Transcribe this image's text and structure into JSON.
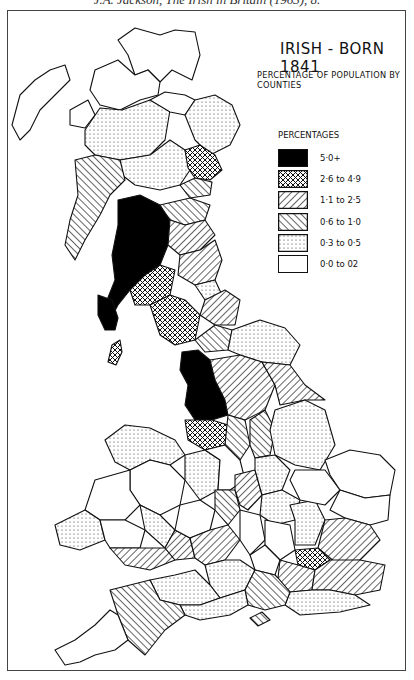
{
  "caption": "J.A. Jackson, The Irish in Britain (1963), 8.",
  "map": {
    "title": "IRISH - BORN 1841",
    "subtitle": "PERCENTAGE OF POPULATION BY COUNTIES",
    "legend": {
      "title": "PERCENTAGES",
      "items": [
        {
          "label": "5·0+",
          "pattern": "solid-black",
          "fill": "#000000"
        },
        {
          "label": "2·6 to 4·9",
          "pattern": "crosshatch"
        },
        {
          "label": "1·1 to 2·5",
          "pattern": "diagonal-forward"
        },
        {
          "label": "0·6 to 1·0",
          "pattern": "diagonal-back"
        },
        {
          "label": "0·3 to 0·5",
          "pattern": "dots"
        },
        {
          "label": "0·0 to 02",
          "pattern": "blank",
          "fill": "#ffffff"
        }
      ]
    },
    "regions_summary": {
      "solid-black": [
        "South-west Scotland (Lanarkshire, Renfrew, Ayr, Dumbarton, Wigtown)",
        "Lancashire"
      ],
      "crosshatch": [
        "Angus/Forfar",
        "Dumfries",
        "Cumberland",
        "Cheshire",
        "Isle of Man",
        "Middlesex (London)"
      ],
      "diagonal-forward": [
        "West Riding of Yorkshire",
        "Durham",
        "Northumberland",
        "Kent",
        "Surrey",
        "Devon"
      ],
      "diagonal-back": [
        "Argyll",
        "Berwick / Borders",
        "Staffordshire",
        "Warwickshire",
        "Hampshire"
      ],
      "dots": [
        "Inverness",
        "Perth",
        "Aberdeen/Banff",
        "North & East Riding",
        "Lincolnshire",
        "Somerset",
        "Wiltshire",
        "Sussex",
        "Welsh counties (part)"
      ],
      "blank": [
        "Sutherland",
        "Caithness",
        "Ross",
        "Norfolk",
        "Suffolk",
        "Cornwall",
        "most of Wales",
        "Midland counties (part)"
      ]
    }
  }
}
